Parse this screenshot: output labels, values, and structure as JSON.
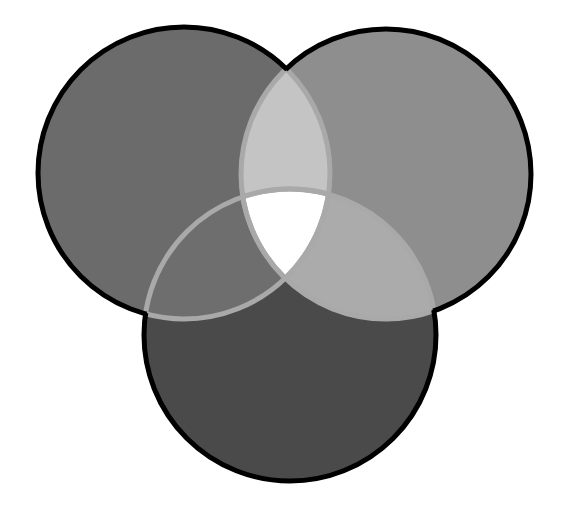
{
  "diagram": {
    "type": "venn",
    "set_count": 3,
    "labels_visible": false,
    "sets": [
      {
        "id": "A",
        "position": "top-left",
        "cx": 184,
        "cy": 173,
        "r": 146,
        "fill": "#6b6b6b"
      },
      {
        "id": "B",
        "position": "top-right",
        "cx": 386,
        "cy": 174,
        "r": 145,
        "fill": "#8e8e8e"
      },
      {
        "id": "C",
        "position": "bottom",
        "cx": 290,
        "cy": 335,
        "r": 146,
        "fill": "#4a4a4a"
      }
    ],
    "intersections": {
      "AB": {
        "fill": "#c4c4c4"
      },
      "AC": {
        "fill": "#6e6e6e"
      },
      "BC": {
        "fill": "#ababab"
      },
      "ABC": {
        "fill": "#ffffff"
      }
    },
    "colors": {
      "background": "#ffffff",
      "outline": "#000000",
      "inner_edge": "#a9a9a9"
    }
  }
}
